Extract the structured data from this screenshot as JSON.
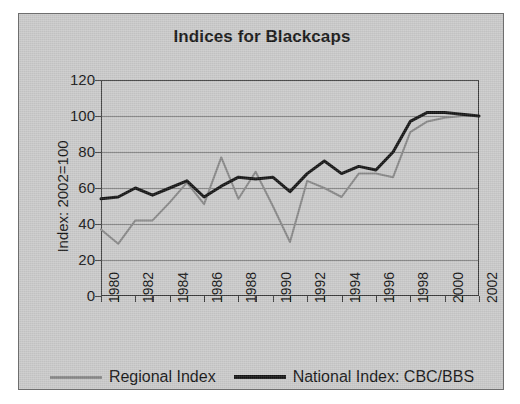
{
  "chart_data": {
    "type": "line",
    "title": "Indices for Blackcaps",
    "xlabel": "",
    "ylabel": "Index: 2002=100",
    "x": [
      1980,
      1981,
      1982,
      1983,
      1984,
      1985,
      1986,
      1987,
      1988,
      1989,
      1990,
      1991,
      1992,
      1993,
      1994,
      1995,
      1996,
      1997,
      1998,
      1999,
      2000,
      2001,
      2002
    ],
    "xtick_labels": [
      "1980",
      "1982",
      "1984",
      "1986",
      "1988",
      "1990",
      "1992",
      "1994",
      "1996",
      "1998",
      "2000",
      "2002"
    ],
    "xtick_values": [
      1980,
      1982,
      1984,
      1986,
      1988,
      1990,
      1992,
      1994,
      1996,
      1998,
      2000,
      2002
    ],
    "xlim": [
      1980,
      2002
    ],
    "ylim": [
      0,
      120
    ],
    "ytick_labels": [
      "0",
      "20",
      "40",
      "60",
      "80",
      "100",
      "120"
    ],
    "ytick_values": [
      0,
      20,
      40,
      60,
      80,
      100,
      120
    ],
    "grid": true,
    "legend_position": "bottom",
    "series": [
      {
        "name": "Regional Index",
        "color": "#878787",
        "width": 2,
        "values": [
          37,
          29,
          42,
          42,
          52,
          63,
          51,
          77,
          54,
          69,
          50,
          30,
          64,
          60,
          55,
          68,
          68,
          66,
          91,
          97,
          99,
          100,
          100
        ]
      },
      {
        "name": "National Index: CBC/BBS",
        "color": "#141414",
        "width": 3,
        "values": [
          54,
          55,
          60,
          56,
          60,
          64,
          55,
          61,
          66,
          65,
          66,
          58,
          68,
          75,
          68,
          72,
          70,
          80,
          97,
          102,
          102,
          101,
          100
        ]
      }
    ]
  },
  "legend": {
    "entries": [
      {
        "label": "Regional Index"
      },
      {
        "label": "National Index: CBC/BBS"
      }
    ]
  },
  "colors": {
    "panel_background": "#c9c9c9",
    "page_background": "#ffffff",
    "axis": "#3a3a3a",
    "grid": "#7d7d7d",
    "regional_series": "#878787",
    "national_series": "#141414",
    "text": "#141414"
  }
}
